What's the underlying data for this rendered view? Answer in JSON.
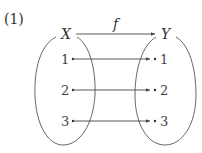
{
  "figure": {
    "label": "(1)",
    "function_name": "f",
    "domain_set": {
      "name": "X",
      "elements": [
        "1",
        "2",
        "3"
      ]
    },
    "codomain_set": {
      "name": "Y",
      "elements": [
        "1",
        "2",
        "3"
      ]
    },
    "mappings": [
      {
        "from": "1",
        "to": "1"
      },
      {
        "from": "2",
        "to": "2"
      },
      {
        "from": "3",
        "to": "3"
      }
    ],
    "colors": {
      "stroke": "#555555",
      "text": "#333333"
    }
  }
}
